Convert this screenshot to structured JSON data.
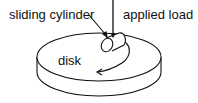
{
  "diagram": {
    "labels": {
      "sliding_cylinder": "sliding cylinder",
      "applied_load": "applied load",
      "disk": "disk"
    },
    "colors": {
      "stroke": "#111111",
      "background": "#ffffff"
    }
  }
}
